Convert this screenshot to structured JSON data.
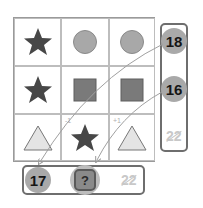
{
  "grid": {
    "rows": [
      [
        "star",
        "circle",
        "circle"
      ],
      [
        "star",
        "square",
        "square"
      ],
      [
        "triangle",
        "star",
        "triangle"
      ]
    ],
    "hints": {
      "r2c1": "-1",
      "r2c2": "+1"
    }
  },
  "row_sums": {
    "values": [
      "18",
      "16"
    ],
    "unknown": "22"
  },
  "col_sums": {
    "values": [
      "17"
    ],
    "question": "?",
    "unknown": "22"
  },
  "colors": {
    "star": "#474747",
    "circle": "#a8a8a8",
    "square": "#7a7a7a",
    "triangle": "#e4e4e4",
    "number_circle": "#a9a9a9",
    "panel_border": "#6e6e6e"
  }
}
